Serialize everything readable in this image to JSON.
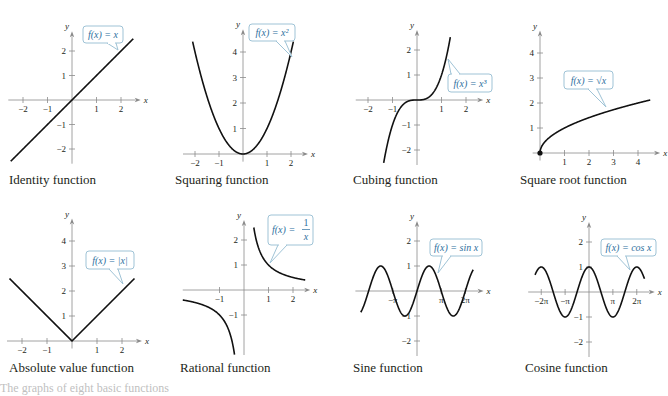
{
  "figure": {
    "colors": {
      "curve": "#111111",
      "axis": "#8a8a8a",
      "bubble_border": "#9fc3d6",
      "bubble_fill": "#ffffff",
      "bubble_text": "#2e6f9e",
      "caption": "#231f20"
    },
    "footer_text": "The graphs of eight basic functions"
  },
  "chart_data": [
    {
      "type": "line",
      "title": "Identity function",
      "label": "f(x) = x",
      "x_ticks": [
        "-2",
        "-1",
        "1",
        "2"
      ],
      "x_tick_values": [
        -2,
        -1,
        1,
        2
      ],
      "y_ticks": [
        "-2",
        "-1",
        "1",
        "2"
      ],
      "y_tick_values": [
        -2,
        -1,
        1,
        2
      ],
      "xlim": [
        -2.6,
        2.6
      ],
      "ylim": [
        -2.6,
        2.6
      ],
      "xlabel": "x",
      "ylabel": "y",
      "function": "x",
      "domain": [
        -2.5,
        2.5
      ]
    },
    {
      "type": "line",
      "title": "Squaring function",
      "label": "f(x) = x²",
      "x_ticks": [
        "-2",
        "-1",
        "1",
        "2"
      ],
      "x_tick_values": [
        -2,
        -1,
        1,
        2
      ],
      "y_ticks": [
        "1",
        "2",
        "3",
        "4"
      ],
      "y_tick_values": [
        1,
        2,
        3,
        4
      ],
      "xlim": [
        -2.5,
        2.5
      ],
      "ylim": [
        -0.3,
        4.7
      ],
      "xlabel": "x",
      "ylabel": "y",
      "function": "x^2",
      "domain": [
        -2.1,
        2.1
      ]
    },
    {
      "type": "line",
      "title": "Cubing function",
      "label": "f(x) = x³",
      "x_ticks": [
        "-2",
        "-1",
        "1",
        "2"
      ],
      "x_tick_values": [
        -2,
        -1,
        1,
        2
      ],
      "y_ticks": [
        "-2",
        "-1",
        "1",
        "2"
      ],
      "y_tick_values": [
        -2,
        -1,
        1,
        2
      ],
      "xlim": [
        -2.5,
        2.5
      ],
      "ylim": [
        -2.6,
        2.6
      ],
      "xlabel": "x",
      "ylabel": "y",
      "function": "x^3",
      "domain": [
        -1.36,
        1.36
      ]
    },
    {
      "type": "line",
      "title": "Square root function",
      "label": "f(x) = √x",
      "x_ticks": [
        "1",
        "2",
        "3",
        "4"
      ],
      "x_tick_values": [
        1,
        2,
        3,
        4
      ],
      "y_ticks": [
        "1",
        "2",
        "3",
        "4"
      ],
      "y_tick_values": [
        1,
        2,
        3,
        4
      ],
      "xlim": [
        -0.3,
        4.7
      ],
      "ylim": [
        -0.3,
        4.7
      ],
      "xlabel": "x",
      "ylabel": "y",
      "function": "sqrt(x)",
      "domain": [
        0,
        4.5
      ],
      "start_point": [
        0,
        0
      ]
    },
    {
      "type": "line",
      "title": "Absolute value function",
      "label": "f(x) = |x|",
      "x_ticks": [
        "-2",
        "-1",
        "1",
        "2"
      ],
      "x_tick_values": [
        -2,
        -1,
        1,
        2
      ],
      "y_ticks": [
        "1",
        "2",
        "3",
        "4"
      ],
      "y_tick_values": [
        1,
        2,
        3,
        4
      ],
      "xlim": [
        -2.6,
        2.6
      ],
      "ylim": [
        -0.3,
        4.7
      ],
      "xlabel": "x",
      "ylabel": "y",
      "function": "|x|",
      "domain": [
        -2.5,
        2.5
      ]
    },
    {
      "type": "line",
      "title": "Rational function",
      "label": "f(x) = 1/x",
      "x_ticks": [
        "-1",
        "1",
        "2"
      ],
      "x_tick_values": [
        -1,
        1,
        2
      ],
      "y_ticks": [
        "-1",
        "1",
        "2"
      ],
      "y_tick_values": [
        -1,
        1,
        2
      ],
      "xlim": [
        -2.5,
        2.5
      ],
      "ylim": [
        -2.6,
        2.6
      ],
      "xlabel": "x",
      "ylabel": "y",
      "function": "1/x",
      "domain": [
        -2.5,
        2.5
      ]
    },
    {
      "type": "line",
      "title": "Sine function",
      "label": "f(x) = sin x",
      "x_ticks": [
        "-π",
        "π",
        "2π"
      ],
      "x_tick_values": [
        -3.1416,
        3.1416,
        6.2832
      ],
      "y_ticks": [
        "-2",
        "-1",
        "1",
        "2"
      ],
      "y_tick_values": [
        -2,
        -1,
        1,
        2
      ],
      "xlim": [
        -8,
        8
      ],
      "ylim": [
        -2.6,
        2.6
      ],
      "xlabel": "x",
      "ylabel": "y",
      "function": "sin(x)",
      "domain": [
        -7.3,
        7.3
      ]
    },
    {
      "type": "line",
      "title": "Cosine function",
      "label": "f(x) = cos x",
      "x_ticks": [
        "-2π",
        "-π",
        "π",
        "2π"
      ],
      "x_tick_values": [
        -6.2832,
        -3.1416,
        3.1416,
        6.2832
      ],
      "y_ticks": [
        "-2",
        "-1",
        "1",
        "2"
      ],
      "y_tick_values": [
        -2,
        -1,
        1,
        2
      ],
      "xlim": [
        -8,
        8
      ],
      "ylim": [
        -2.6,
        2.6
      ],
      "xlabel": "x",
      "ylabel": "y",
      "function": "cos(x)",
      "domain": [
        -7.1,
        7.3
      ]
    }
  ],
  "panels": [
    {
      "caption": "Identity function"
    },
    {
      "caption": "Squaring function"
    },
    {
      "caption": "Cubing function"
    },
    {
      "caption": "Square root function"
    },
    {
      "caption": "Absolute value function"
    },
    {
      "caption": "Rational function"
    },
    {
      "caption": "Sine function"
    },
    {
      "caption": "Cosine function"
    }
  ]
}
